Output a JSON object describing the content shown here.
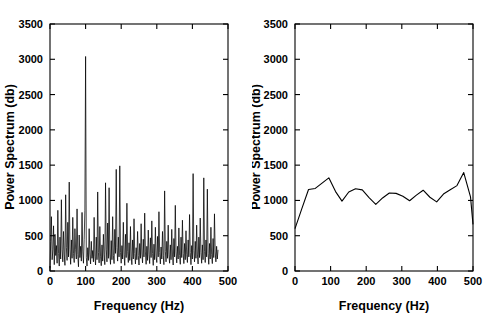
{
  "figure": {
    "background": "#ffffff",
    "axis_color": "#000000",
    "series_color": "#000000",
    "panel_count": 2
  },
  "panels": [
    {
      "id": "left",
      "name": "raw-periodogram",
      "xlabel": "Frequency (Hz)",
      "ylabel": "Power Spectrum (db)",
      "xticks": [
        0,
        100,
        200,
        300,
        400,
        500
      ],
      "yticks": [
        0,
        500,
        1000,
        1500,
        2000,
        2500,
        3000,
        3500
      ],
      "xlim": [
        0,
        500
      ],
      "ylim": [
        0,
        3500
      ]
    },
    {
      "id": "right",
      "name": "smoothed-spectrum",
      "xlabel": "Frequency (Hz)",
      "ylabel": "Power Spectrum (db)",
      "xticks": [
        0,
        100,
        200,
        300,
        400,
        500
      ],
      "yticks": [
        0,
        500,
        1000,
        1500,
        2000,
        2500,
        3000,
        3500
      ],
      "xlim": [
        0,
        500
      ],
      "ylim": [
        0,
        3500
      ]
    }
  ],
  "chart_data": [
    {
      "type": "line",
      "id": "left",
      "title": "",
      "xlabel": "Frequency (Hz)",
      "ylabel": "Power Spectrum (db)",
      "xlim": [
        0,
        500
      ],
      "ylim": [
        0,
        3500
      ],
      "xticks": [
        0,
        100,
        200,
        300,
        400,
        500
      ],
      "yticks": [
        0,
        500,
        1000,
        1500,
        2000,
        2500,
        3000,
        3500
      ],
      "grid": false,
      "legend": false,
      "annotations": [
        "dominant spectral peak near 100 Hz reaching about 3040 db"
      ],
      "series": [
        {
          "name": "raw periodogram",
          "x": [
            0,
            2,
            4,
            6,
            8,
            10,
            12,
            14,
            16,
            18,
            20,
            22,
            24,
            26,
            28,
            30,
            32,
            34,
            36,
            38,
            40,
            42,
            44,
            46,
            48,
            50,
            52,
            54,
            56,
            58,
            60,
            62,
            64,
            66,
            68,
            70,
            72,
            74,
            76,
            78,
            80,
            82,
            84,
            86,
            88,
            90,
            92,
            94,
            96,
            98,
            100,
            102,
            104,
            106,
            108,
            110,
            112,
            114,
            116,
            118,
            120,
            122,
            124,
            126,
            128,
            130,
            132,
            134,
            136,
            138,
            140,
            142,
            144,
            146,
            148,
            150,
            152,
            154,
            156,
            158,
            160,
            162,
            164,
            166,
            168,
            170,
            172,
            174,
            176,
            178,
            180,
            182,
            184,
            186,
            188,
            190,
            192,
            194,
            196,
            198,
            200,
            202,
            204,
            206,
            208,
            210,
            212,
            214,
            216,
            218,
            220,
            222,
            224,
            226,
            228,
            230,
            232,
            234,
            236,
            238,
            240,
            242,
            244,
            246,
            248,
            250,
            252,
            254,
            256,
            258,
            260,
            262,
            264,
            266,
            268,
            270,
            272,
            274,
            276,
            278,
            280,
            282,
            284,
            286,
            288,
            290,
            292,
            294,
            296,
            298,
            300,
            302,
            304,
            306,
            308,
            310,
            312,
            314,
            316,
            318,
            320,
            322,
            324,
            326,
            328,
            330,
            332,
            334,
            336,
            338,
            340,
            342,
            344,
            346,
            348,
            350,
            352,
            354,
            356,
            358,
            360,
            362,
            364,
            366,
            368,
            370,
            372,
            374,
            376,
            378,
            380,
            382,
            384,
            386,
            388,
            390,
            392,
            394,
            396,
            398,
            400,
            402,
            404,
            406,
            408,
            410,
            412,
            414,
            416,
            418,
            420,
            422,
            424,
            426,
            428,
            430,
            432,
            434,
            436,
            438,
            440,
            442,
            444,
            446,
            448,
            450,
            452,
            454,
            456,
            458,
            460,
            462,
            464,
            466,
            468,
            470,
            472,
            474,
            476,
            478,
            480,
            482,
            484,
            486,
            488,
            490,
            492,
            494,
            496,
            498,
            500
          ],
          "y": [
            40,
            420,
            770,
            160,
            300,
            640,
            90,
            520,
            220,
            360,
            110,
            860,
            250,
            70,
            480,
            170,
            1010,
            300,
            130,
            560,
            240,
            80,
            1080,
            330,
            150,
            690,
            200,
            1260,
            310,
            95,
            440,
            180,
            760,
            250,
            120,
            600,
            300,
            170,
            880,
            230,
            60,
            510,
            190,
            350,
            140,
            830,
            270,
            110,
            450,
            860,
            3040,
            190,
            70,
            330,
            150,
            600,
            240,
            100,
            420,
            180,
            290,
            130,
            760,
            210,
            85,
            480,
            160,
            1120,
            260,
            115,
            630,
            200,
            75,
            370,
            140,
            520,
            230,
            90,
            1250,
            310,
            130,
            680,
            180,
            1180,
            240,
            95,
            430,
            160,
            770,
            220,
            105,
            590,
            250,
            1440,
            330,
            140,
            480,
            200,
            1490,
            260,
            110,
            360,
            170,
            690,
            230,
            80,
            520,
            190,
            960,
            280,
            120,
            400,
            150,
            630,
            210,
            90,
            440,
            170,
            740,
            250,
            100,
            330,
            160,
            560,
            220,
            85,
            390,
            180,
            670,
            240,
            115,
            450,
            200,
            820,
            270,
            95,
            350,
            150,
            580,
            230,
            105,
            470,
            190,
            710,
            250,
            80,
            380,
            160,
            620,
            210,
            120,
            490,
            200,
            840,
            260,
            100,
            340,
            170,
            560,
            220,
            90,
            1135,
            280,
            130,
            420,
            180,
            650,
            230,
            110,
            370,
            160,
            590,
            240,
            85,
            460,
            200,
            930,
            270,
            115,
            350,
            170,
            610,
            220,
            95,
            480,
            190,
            720,
            250,
            105,
            390,
            160,
            570,
            230,
            120,
            440,
            200,
            800,
            260,
            90,
            360,
            170,
            1380,
            290,
            130,
            420,
            180,
            650,
            240,
            100,
            480,
            190,
            750,
            260,
            110,
            370,
            160,
            1320,
            280,
            120,
            440,
            200,
            1160,
            250,
            95,
            390,
            170,
            620,
            230,
            105,
            460,
            190,
            810,
            270,
            130,
            350,
            170,
            300
          ]
        }
      ]
    },
    {
      "type": "line",
      "id": "right",
      "title": "",
      "xlabel": "Frequency (Hz)",
      "ylabel": "Power Spectrum (db)",
      "xlim": [
        0,
        500
      ],
      "ylim": [
        0,
        3500
      ],
      "xticks": [
        0,
        100,
        200,
        300,
        400,
        500
      ],
      "yticks": [
        0,
        500,
        1000,
        1500,
        2000,
        2500,
        3000,
        3500
      ],
      "grid": false,
      "legend": false,
      "annotations": [
        "smoothed spectrum is roughly flat near 1000-1400 db, dropping at both ends"
      ],
      "series": [
        {
          "name": "smoothed spectrum",
          "x": [
            0,
            19,
            38,
            57,
            76,
            95,
            114,
            132,
            151,
            170,
            189,
            208,
            227,
            246,
            265,
            284,
            303,
            322,
            341,
            360,
            379,
            398,
            417,
            436,
            455,
            474,
            493,
            500
          ],
          "y": [
            600,
            880,
            1155,
            1170,
            1245,
            1320,
            1125,
            990,
            1120,
            1165,
            1150,
            1040,
            945,
            1035,
            1105,
            1100,
            1060,
            995,
            1075,
            1145,
            1045,
            980,
            1090,
            1150,
            1210,
            1395,
            1050,
            660
          ]
        }
      ]
    }
  ]
}
